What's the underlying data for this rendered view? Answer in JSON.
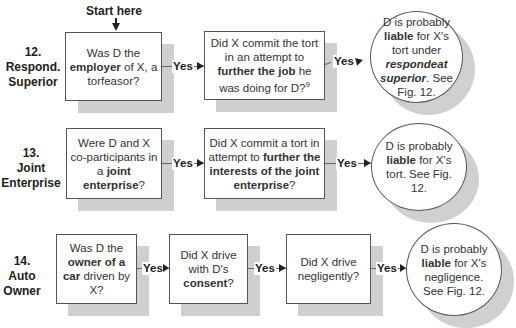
{
  "start": {
    "label": "Start here"
  },
  "rows": [
    {
      "id": "12",
      "label_num": "12.",
      "label_line1": "Respond.",
      "label_line2": "Superior",
      "q1": {
        "pre": "Was D the ",
        "bold": "employer",
        "post": " of X, a torfeasor?"
      },
      "q2": {
        "pre": "Did X commit the tort in an attempt to ",
        "bold": "further the job",
        "post": " he was doing for D?",
        "footnote": "9"
      },
      "yes1": "Yes",
      "yes2": "Yes",
      "result": {
        "pre": "D is probably ",
        "bold": "liable",
        "mid": " for X's tort under ",
        "bolditalic": "respondeat superior",
        "post": ". See Fig. 12."
      }
    },
    {
      "id": "13",
      "label_num": "13.",
      "label_line1": "Joint",
      "label_line2": "Enterprise",
      "q1": {
        "pre": "Were D and X co-participants in a ",
        "bold": "joint enterprise",
        "post": "?"
      },
      "q2": {
        "pre": "Did X commit a tort in attempt to ",
        "bold": "further the interests of the joint enterprise",
        "post": "?"
      },
      "yes1": "Yes",
      "yes2": "Yes",
      "result": {
        "pre": "D is probably ",
        "bold": "liable",
        "post": " for X's tort. See Fig. 12."
      }
    },
    {
      "id": "14",
      "label_num": "14.",
      "label_line1": "Auto",
      "label_line2": "Owner",
      "q1": {
        "pre": "Was D the ",
        "bold": "owner of a car",
        "post": " driven by X?"
      },
      "q2": {
        "pre": "Did X drive with D's ",
        "bold": "consent",
        "post": "?"
      },
      "q3": {
        "pre": "Did X drive negligently?"
      },
      "yes1": "Yes",
      "yes2": "Yes",
      "yes3": "Yes",
      "result": {
        "pre": "D is probably ",
        "bold": "liable",
        "post": " for X's negligence. See Fig. 12."
      }
    }
  ],
  "colors": {
    "shadow": "#cfcfcf",
    "border": "#555555",
    "text": "#222222"
  }
}
